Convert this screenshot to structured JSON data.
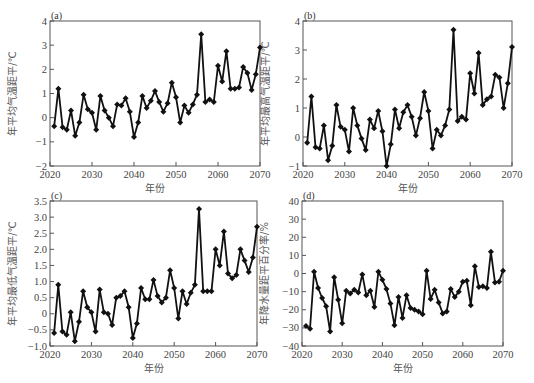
{
  "figure": {
    "xlabel": "年份",
    "x_ticks": [
      2020,
      2030,
      2040,
      2050,
      2060,
      2070
    ]
  },
  "chart_data": [
    {
      "type": "line",
      "panel": "(a)",
      "title": "(a)",
      "xlabel": "年份",
      "ylabel": "年平均气温距平/℃",
      "xlim": [
        2020,
        2070
      ],
      "ylim": [
        -2,
        4
      ],
      "y_ticks": [
        -2,
        -1,
        0,
        1,
        2,
        3,
        4
      ],
      "y_tick_labels": [
        "-2",
        "-1",
        "0",
        "1",
        "2",
        "3",
        "4"
      ],
      "grid": false,
      "x": [
        2021,
        2022,
        2023,
        2024,
        2025,
        2026,
        2027,
        2028,
        2029,
        2030,
        2031,
        2032,
        2033,
        2034,
        2035,
        2036,
        2037,
        2038,
        2039,
        2040,
        2041,
        2042,
        2043,
        2044,
        2045,
        2046,
        2047,
        2048,
        2049,
        2050,
        2051,
        2052,
        2053,
        2054,
        2055,
        2056,
        2057,
        2058,
        2059,
        2060,
        2061,
        2062,
        2063,
        2064,
        2065,
        2066,
        2067,
        2068,
        2069,
        2070
      ],
      "values": [
        -0.35,
        1.2,
        -0.4,
        -0.5,
        0.3,
        -0.75,
        -0.2,
        0.95,
        0.35,
        0.2,
        -0.5,
        0.9,
        0.3,
        0.0,
        -0.35,
        0.55,
        0.5,
        0.8,
        0.25,
        -0.8,
        -0.2,
        0.9,
        0.4,
        0.7,
        1.1,
        0.65,
        0.25,
        0.6,
        1.45,
        0.85,
        -0.2,
        0.5,
        0.2,
        0.55,
        0.95,
        3.45,
        0.65,
        0.75,
        0.65,
        2.15,
        1.5,
        2.75,
        1.2,
        1.2,
        1.25,
        2.1,
        1.85,
        1.15,
        1.8,
        2.9
      ]
    },
    {
      "type": "line",
      "panel": "(b)",
      "title": "(b)",
      "xlabel": "年份",
      "ylabel": "年平均最高气温距平/℃",
      "xlim": [
        2020,
        2070
      ],
      "ylim": [
        -1,
        4
      ],
      "y_ticks": [
        -1,
        0,
        1,
        2,
        3,
        4
      ],
      "y_tick_labels": [
        "-1",
        "0",
        "1",
        "2",
        "3",
        "4"
      ],
      "grid": false,
      "x": [
        2021,
        2022,
        2023,
        2024,
        2025,
        2026,
        2027,
        2028,
        2029,
        2030,
        2031,
        2032,
        2033,
        2034,
        2035,
        2036,
        2037,
        2038,
        2039,
        2040,
        2041,
        2042,
        2043,
        2044,
        2045,
        2046,
        2047,
        2048,
        2049,
        2050,
        2051,
        2052,
        2053,
        2054,
        2055,
        2056,
        2057,
        2058,
        2059,
        2060,
        2061,
        2062,
        2063,
        2064,
        2065,
        2066,
        2067,
        2068,
        2069,
        2070
      ],
      "values": [
        -0.2,
        1.4,
        -0.35,
        -0.4,
        0.4,
        -0.8,
        -0.3,
        1.1,
        0.35,
        0.25,
        -0.5,
        1.0,
        0.4,
        -0.05,
        -0.45,
        0.6,
        0.3,
        0.9,
        0.2,
        -1.0,
        -0.25,
        0.95,
        0.3,
        0.85,
        1.1,
        0.7,
        0.05,
        0.65,
        1.55,
        0.9,
        -0.4,
        0.25,
        0.05,
        0.4,
        0.95,
        3.7,
        0.55,
        0.7,
        0.6,
        2.2,
        1.5,
        2.9,
        1.1,
        1.3,
        1.4,
        2.15,
        2.05,
        1.0,
        1.85,
        3.1
      ]
    },
    {
      "type": "line",
      "panel": "(c)",
      "title": "(c)",
      "xlabel": "年份",
      "ylabel": "年平均最低气温距平/℃",
      "xlim": [
        2020,
        2070
      ],
      "ylim": [
        -1.0,
        3.5
      ],
      "y_ticks": [
        -1.0,
        -0.5,
        0,
        0.5,
        1.0,
        1.5,
        2.0,
        2.5,
        3.0,
        3.5
      ],
      "y_tick_labels": [
        "-1.0",
        "-0.5",
        "0",
        "0.5",
        "1.0",
        "1.5",
        "2.0",
        "2.5",
        "3.0",
        "3.5"
      ],
      "grid": false,
      "x": [
        2021,
        2022,
        2023,
        2024,
        2025,
        2026,
        2027,
        2028,
        2029,
        2030,
        2031,
        2032,
        2033,
        2034,
        2035,
        2036,
        2037,
        2038,
        2039,
        2040,
        2041,
        2042,
        2043,
        2044,
        2045,
        2046,
        2047,
        2048,
        2049,
        2050,
        2051,
        2052,
        2053,
        2054,
        2055,
        2056,
        2057,
        2058,
        2059,
        2060,
        2061,
        2062,
        2063,
        2064,
        2065,
        2066,
        2067,
        2068,
        2069,
        2070
      ],
      "values": [
        -0.6,
        0.9,
        -0.55,
        -0.65,
        0.05,
        -0.85,
        -0.25,
        0.7,
        0.2,
        0.05,
        -0.55,
        0.75,
        0.05,
        0.0,
        -0.35,
        0.5,
        0.55,
        0.7,
        0.2,
        -0.75,
        -0.3,
        0.8,
        0.45,
        0.45,
        1.05,
        0.55,
        0.35,
        0.5,
        1.35,
        0.8,
        -0.15,
        0.7,
        0.3,
        0.65,
        0.9,
        3.25,
        0.7,
        0.7,
        0.7,
        2.0,
        1.5,
        2.55,
        1.25,
        1.1,
        1.2,
        2.0,
        1.65,
        1.3,
        1.75,
        2.7
      ]
    },
    {
      "type": "line",
      "panel": "(d)",
      "title": "(d)",
      "xlabel": "年份",
      "ylabel": "年降水量距平百分率/%",
      "xlim": [
        2020,
        2070
      ],
      "ylim": [
        -40,
        40
      ],
      "y_ticks": [
        -40,
        -30,
        -20,
        -10,
        0,
        10,
        20,
        30,
        40
      ],
      "y_tick_labels": [
        "-40",
        "-30",
        "-20",
        "-10",
        "0",
        "10",
        "20",
        "30",
        "40"
      ],
      "grid": false,
      "x": [
        2021,
        2022,
        2023,
        2024,
        2025,
        2026,
        2027,
        2028,
        2029,
        2030,
        2031,
        2032,
        2033,
        2034,
        2035,
        2036,
        2037,
        2038,
        2039,
        2040,
        2041,
        2042,
        2043,
        2044,
        2045,
        2046,
        2047,
        2048,
        2049,
        2050,
        2051,
        2052,
        2053,
        2054,
        2055,
        2056,
        2057,
        2058,
        2059,
        2060,
        2061,
        2062,
        2063,
        2064,
        2065,
        2066,
        2067,
        2068,
        2069,
        2070
      ],
      "values": [
        -29,
        -30.5,
        1,
        -8,
        -13.5,
        -18,
        -32,
        -2,
        -14.5,
        -27.5,
        -9.5,
        -11,
        -9,
        -10.5,
        -0.5,
        -12,
        -9.5,
        -18.5,
        1,
        -3.5,
        -8.5,
        -16.5,
        -28.5,
        -13,
        -24.5,
        -12,
        -19,
        -20,
        -21,
        -22.5,
        1.5,
        -14,
        -9,
        -16,
        -22,
        -21,
        -8.5,
        -13,
        -10,
        -4.5,
        -4,
        -17.5,
        4,
        -7.5,
        -7,
        -8,
        12,
        -5,
        -4.5,
        1.5
      ]
    }
  ]
}
